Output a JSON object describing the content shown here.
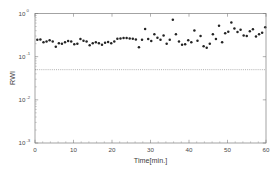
{
  "chart_data": {
    "type": "scatter",
    "title": "",
    "xlabel": "Time[min.]",
    "ylabel": "RWI",
    "yscale": "log",
    "xscale": "linear",
    "xlim": [
      0,
      60
    ],
    "ylim": [
      0.001,
      1
    ],
    "grid": false,
    "legend": null,
    "xticks": [
      0,
      10,
      20,
      30,
      40,
      50,
      60
    ],
    "xtick_labels": [
      "0",
      "10",
      "20",
      "30",
      "40",
      "50",
      "60"
    ],
    "yticks": [
      1,
      0.1,
      0.01,
      0.001
    ],
    "ytick_labels": [
      "10^0",
      "10^-1",
      "10^-2",
      "10^-3"
    ],
    "ytick_mantissas": [
      "10",
      "10",
      "10",
      "10"
    ],
    "ytick_exponents": [
      "0",
      "-1",
      "-2",
      "-3"
    ],
    "marker_style": "dot",
    "marker_color": "#242424",
    "threshold_line": {
      "value": 0.05,
      "style": "dotted",
      "color": "#8e8e8e",
      "orientation": "horizontal"
    },
    "series": [
      {
        "name": "RWI",
        "x": [
          0.6,
          1.4,
          2.2,
          3.0,
          3.8,
          4.6,
          5.4,
          6.2,
          7.0,
          7.8,
          8.6,
          9.4,
          10.2,
          11.0,
          11.8,
          12.6,
          13.4,
          14.2,
          15.0,
          15.8,
          16.6,
          17.4,
          18.2,
          19.0,
          19.8,
          20.6,
          21.4,
          22.2,
          23.0,
          23.8,
          24.6,
          25.4,
          26.2,
          27.0,
          27.8,
          28.6,
          29.4,
          30.2,
          31.0,
          31.8,
          32.6,
          33.4,
          34.2,
          35.0,
          35.8,
          36.6,
          37.4,
          38.2,
          39.0,
          39.8,
          40.6,
          41.4,
          42.2,
          43.0,
          43.8,
          44.6,
          45.4,
          46.2,
          47.0,
          47.8,
          48.6,
          49.4,
          50.2,
          51.0,
          51.8,
          52.6,
          53.4,
          54.2,
          55.0,
          55.8,
          56.6,
          57.4,
          58.2,
          59.0,
          59.8
        ],
        "y": [
          0.245,
          0.25,
          0.215,
          0.225,
          0.24,
          0.225,
          0.17,
          0.205,
          0.2,
          0.215,
          0.23,
          0.225,
          0.195,
          0.2,
          0.255,
          0.235,
          0.225,
          0.185,
          0.205,
          0.215,
          0.205,
          0.19,
          0.21,
          0.22,
          0.205,
          0.225,
          0.26,
          0.265,
          0.27,
          0.27,
          0.265,
          0.26,
          0.25,
          0.165,
          0.245,
          0.44,
          0.255,
          0.23,
          0.33,
          0.275,
          0.245,
          0.31,
          0.2,
          0.245,
          0.72,
          0.33,
          0.225,
          0.19,
          0.195,
          0.24,
          0.215,
          0.405,
          0.235,
          0.3,
          0.175,
          0.16,
          0.2,
          0.33,
          0.255,
          0.52,
          0.215,
          0.35,
          0.38,
          0.62,
          0.45,
          0.375,
          0.42,
          0.31,
          0.3,
          0.39,
          0.43,
          0.295,
          0.33,
          0.36,
          0.48
        ]
      }
    ]
  },
  "figure": {
    "background_color": "#ffffff",
    "axis_color": "#7d7d7d",
    "text_color": "#4a4a4a"
  }
}
